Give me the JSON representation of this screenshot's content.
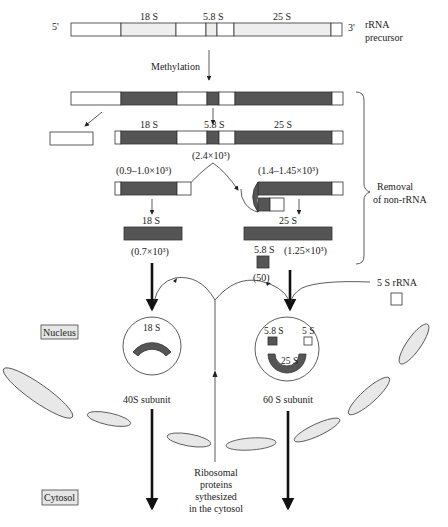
{
  "precursor": {
    "five_prime": "5'",
    "three_prime": "3'",
    "label_line1": "rRNA",
    "label_line2": "precursor",
    "segments": [
      "18 S",
      "5.8 S",
      "25 S"
    ]
  },
  "methylation_label": "Methylation",
  "step2": {
    "labels": [
      "18 S",
      "5.8 S",
      "25 S"
    ],
    "size": "(2.4×10³)"
  },
  "step3": {
    "left_size": "(0.9–1.0×10³)",
    "right_size": "(1.4–1.45×10³)"
  },
  "products": {
    "rRNA_18S_label": "18 S",
    "rRNA_18S_size": "(0.7×10³)",
    "rRNA_25S_label": "25 S",
    "rRNA_25S_size": "(1.25×10³)",
    "rRNA_5_8S_label": "5.8 S",
    "rRNA_5_8S_size": "(50)"
  },
  "removal_label_line1": "Removal",
  "removal_label_line2": "of non-rRNA",
  "five_s_rRNA_label": "5 S rRNA",
  "compartments": {
    "nucleus": "Nucleus",
    "cytosol": "Cytosol"
  },
  "subunits": {
    "small": {
      "rna": "18 S",
      "label": "40S subunit"
    },
    "large": {
      "rna_5_8": "5.8 S",
      "rna_5": "5 S",
      "rna_25": "25 S",
      "label": "60 S subunit"
    }
  },
  "proteins_label": [
    "Ribosomal",
    "proteins",
    "sythesized",
    "in the cytosol"
  ],
  "colors": {
    "rRNA_mature": "#555555",
    "rRNA_precursor_region": "#eeeeee",
    "spacer": "#ffffff",
    "membrane": "#e8e8e8"
  }
}
